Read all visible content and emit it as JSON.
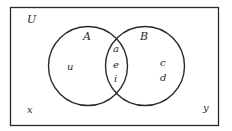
{
  "diagram": {
    "type": "venn",
    "universe": {
      "label": "U",
      "outside_elements": [
        "x",
        "y"
      ]
    },
    "sets": [
      {
        "label": "A",
        "only_elements": [
          "u"
        ]
      },
      {
        "label": "B",
        "only_elements": [
          "c",
          "d"
        ]
      }
    ],
    "intersection": {
      "elements": [
        "a",
        "e",
        "i"
      ]
    },
    "colors": {
      "stroke": "#2a2a2a",
      "background": "#ffffff"
    }
  }
}
